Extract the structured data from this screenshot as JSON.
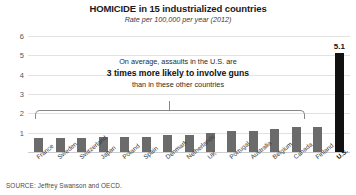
{
  "chart_data": {
    "type": "bar",
    "title": "HOMICIDE in 15 industrialized countries",
    "subtitle": "Rate per 100,000 per year (2012)",
    "xlabel": "",
    "ylabel": "",
    "ylim": [
      0,
      6
    ],
    "yticks": [
      0,
      1,
      2,
      3,
      4,
      5,
      6
    ],
    "ytick_labels": [
      "",
      "1",
      "2",
      "3",
      "4",
      "5",
      "6"
    ],
    "grid": true,
    "legend": "none",
    "categories": [
      "France",
      "Sweden",
      "Switzerland",
      "Japan",
      "Poland",
      "Spain",
      "Denmark",
      "Netherlands",
      "UK",
      "Portugal",
      "Australia",
      "Belgium",
      "Canada",
      "Finland",
      "U.S."
    ],
    "values": [
      0.7,
      0.7,
      0.7,
      0.8,
      0.8,
      0.8,
      0.9,
      0.9,
      1.0,
      1.1,
      1.1,
      1.2,
      1.3,
      1.3,
      5.1
    ],
    "bar_colors": [
      "#6b6b6b",
      "#6b6b6b",
      "#6b6b6b",
      "#6b6b6b",
      "#6b6b6b",
      "#6b6b6b",
      "#6b6b6b",
      "#6b6b6b",
      "#6b6b6b",
      "#6b6b6b",
      "#6b6b6b",
      "#6b6b6b",
      "#6b6b6b",
      "#6b6b6b",
      "#111111"
    ],
    "data_labels": [
      "",
      "",
      "",
      "",
      "",
      "",
      "",
      "",
      "",
      "",
      "",
      "",
      "",
      "",
      "5.1"
    ],
    "highlight_category": "U.S.",
    "annotations": [
      {
        "line_1": "On average, assaults in the U.S. are",
        "line_2": "3 times more likely to involve guns",
        "line_3": "than in these other countries"
      }
    ],
    "bracket": {
      "spans": [
        "France",
        "Finland"
      ],
      "note": "groups the 14 non-U.S. countries"
    },
    "source": "SOURCE: Jeffrey Swanson and OECD."
  },
  "colors": {
    "bar": "#6b6b6b",
    "highlight_bar": "#111111",
    "gridline": "#e2e2e2",
    "bracket": "#888888",
    "background": "#ffffff"
  }
}
